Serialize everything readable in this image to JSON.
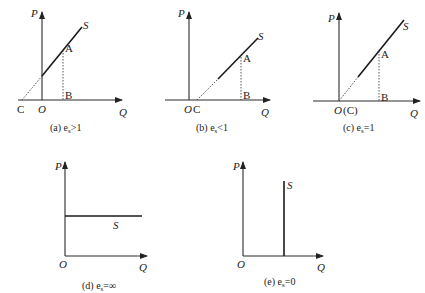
{
  "panels": [
    {
      "id": "a",
      "caption": "(a)  e",
      "caption_sub": "s",
      "caption_rel": ">1",
      "axis_y": "P",
      "axis_x": "Q",
      "supply_label": "S",
      "point_a": "A",
      "point_b": "B",
      "origin": "O",
      "intercept": "C"
    },
    {
      "id": "b",
      "caption": "(b)  e",
      "caption_sub": "s",
      "caption_rel": "<1",
      "axis_y": "P",
      "axis_x": "Q",
      "supply_label": "S",
      "point_a": "A",
      "point_b": "B",
      "origin": "O",
      "intercept": "C"
    },
    {
      "id": "c",
      "caption": "(c)  e",
      "caption_sub": "s",
      "caption_rel": "=1",
      "axis_y": "P",
      "axis_x": "Q",
      "supply_label": "S",
      "point_a": "A",
      "point_b": "B",
      "origin": "O",
      "intercept": "(C)"
    },
    {
      "id": "d",
      "caption": "(d)  e",
      "caption_sub": "s",
      "caption_rel": "=∞",
      "axis_y": "P",
      "axis_x": "Q",
      "supply_label": "S",
      "origin": "O"
    },
    {
      "id": "e",
      "caption": "(e)  e",
      "caption_sub": "s",
      "caption_rel": "=0",
      "axis_y": "P",
      "axis_x": "Q",
      "supply_label": "S",
      "origin": "O"
    }
  ],
  "colors": {
    "line": "#1a1a1a",
    "text": "#222222",
    "background": "#ffffff"
  }
}
